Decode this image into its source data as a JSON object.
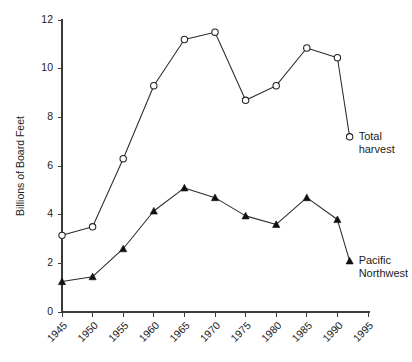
{
  "chart_data": {
    "type": "line",
    "title": "",
    "xlabel": "",
    "ylabel": "Billions of Board Feet",
    "xlim": [
      1945,
      1995
    ],
    "ylim": [
      0,
      12
    ],
    "grid": false,
    "legend_position": "inline-right",
    "x_ticks": [
      "1945",
      "1950",
      "1955",
      "1960",
      "1965",
      "1970",
      "1975",
      "1980",
      "1985",
      "1990",
      "1995"
    ],
    "y_ticks": [
      "0",
      "2",
      "4",
      "6",
      "8",
      "10",
      "12"
    ],
    "x": [
      1945,
      1950,
      1955,
      1960,
      1965,
      1970,
      1975,
      1980,
      1985,
      1990,
      1992
    ],
    "series": [
      {
        "name": "Total harvest",
        "label_line1": "Total",
        "label_line2": "harvest",
        "marker": "open-circle",
        "color": "#222222",
        "values": [
          3.15,
          3.5,
          6.3,
          9.3,
          11.2,
          11.5,
          8.7,
          9.3,
          10.85,
          10.45,
          7.2
        ]
      },
      {
        "name": "Pacific Northwest",
        "label_line1": "Pacific",
        "label_line2": "Northwest",
        "marker": "filled-triangle",
        "color": "#111111",
        "values": [
          1.25,
          1.45,
          2.6,
          4.15,
          5.1,
          4.7,
          3.95,
          3.6,
          4.7,
          3.8,
          2.1
        ]
      }
    ]
  },
  "colors": {
    "axis": "#3a3a3a",
    "line": "#2b2b2b",
    "background": "#ffffff",
    "text": "#1c1c1c"
  }
}
